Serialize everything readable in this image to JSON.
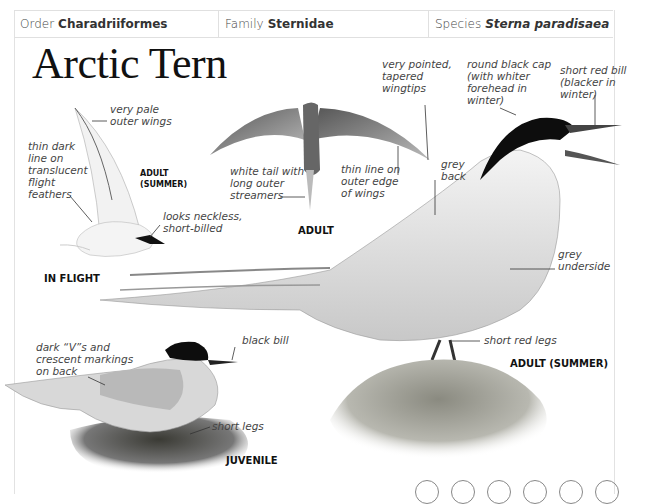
{
  "taxonomy": [
    {
      "label": "Order",
      "value": "Charadriiformes",
      "italic": false
    },
    {
      "label": "Family",
      "value": "Sternidae",
      "italic": false
    },
    {
      "label": "Species",
      "value": "Sterna paradisaea",
      "italic": true
    }
  ],
  "title": "Arctic Tern",
  "captions": {
    "in_flight": "IN FLIGHT",
    "adult_summer_small": "ADULT\n(SUMMER)",
    "adult": "ADULT",
    "adult_summer": "ADULT (SUMMER)",
    "juvenile": "JUVENILE"
  },
  "annotations": {
    "pale_outer_wings": "very pale\nouter wings",
    "thin_dark_line": "thin dark\nline on\ntranslucent\nflight\nfeathers",
    "neckless": "looks neckless,\nshort-billed",
    "white_tail": "white tail with\nlong outer\nstreamers",
    "thin_line_outer": "thin line on\nouter edge\nof wings",
    "pointed_wingtips": "very pointed,\ntapered\nwingtips",
    "grey_back": "grey\nback",
    "black_cap": "round black cap\n(with whiter\nforehead in\nwinter)",
    "red_bill": "short red bill\n(blacker in\nwinter)",
    "grey_underside": "grey\nunderside",
    "red_legs": "short red legs",
    "dark_vs": "dark “V”s and\ncrescent markings\non back",
    "black_bill": "black bill",
    "short_legs": "short legs"
  },
  "footer_circles": 6
}
